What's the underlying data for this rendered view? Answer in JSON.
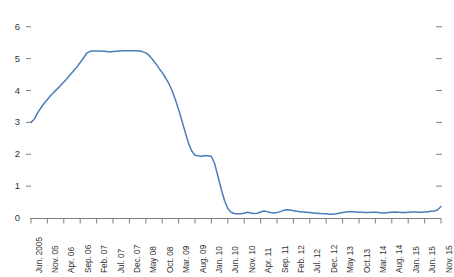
{
  "chart_data": {
    "type": "line",
    "title": "",
    "subtitle": "",
    "xlabel": "",
    "ylabel": "",
    "legend": [],
    "legend_position": "none",
    "grid": false,
    "xlim": [
      0,
      125
    ],
    "ylim": [
      0,
      6.4
    ],
    "y_ticks": [
      "0",
      "1",
      "2",
      "3",
      "4",
      "5",
      "6"
    ],
    "y_tick_values": [
      0,
      1,
      2,
      3,
      4,
      5,
      6
    ],
    "right_axis_ticks": [
      1,
      2,
      3,
      4,
      5,
      6
    ],
    "categories": [
      "Jun. 2005",
      "Nov. 05",
      "Apr. 06",
      "Sep. 06",
      "Feb. 07",
      "Jul. 07",
      "Dec. 07",
      "May 08",
      "Oct. 08",
      "Mar. 09",
      "Aug. 09",
      "Jan. 10",
      "Jun. 10",
      "Nov. 10",
      "Apr. 11",
      "Sep. 11",
      "Feb. 12",
      "Jul. 12",
      "Dec. 12",
      "May 13",
      "Oct.13",
      "Mar. 14",
      "Aug. 14",
      "Jan. 15",
      "Jun. 15",
      "Nov. 15"
    ],
    "category_index_step": 5,
    "series": [
      {
        "name": "",
        "color": "#4a7ebb",
        "x": [
          0,
          1,
          2,
          3,
          4,
          5,
          6,
          7,
          8,
          9,
          10,
          11,
          12,
          13,
          14,
          15,
          16,
          17,
          18,
          19,
          20,
          21,
          22,
          23,
          24,
          25,
          26,
          27,
          28,
          29,
          30,
          31,
          32,
          33,
          34,
          35,
          36,
          37,
          38,
          39,
          40,
          41,
          42,
          43,
          44,
          45,
          46,
          47,
          48,
          49,
          50,
          51,
          52,
          53,
          54,
          55,
          56,
          57,
          58,
          59,
          60,
          61,
          62,
          63,
          64,
          65,
          66,
          67,
          68,
          69,
          70,
          71,
          72,
          73,
          74,
          75,
          76,
          77,
          78,
          79,
          80,
          81,
          82,
          83,
          84,
          85,
          86,
          87,
          88,
          89,
          90,
          91,
          92,
          93,
          94,
          95,
          96,
          97,
          98,
          99,
          100,
          101,
          102,
          103,
          104,
          105,
          106,
          107,
          108,
          109,
          110,
          111,
          112,
          113,
          114,
          115,
          116,
          117,
          118,
          119,
          120,
          121,
          122,
          123,
          124,
          125
        ],
        "values": [
          3.0,
          3.1,
          3.3,
          3.45,
          3.6,
          3.72,
          3.84,
          3.95,
          4.05,
          4.16,
          4.27,
          4.38,
          4.5,
          4.62,
          4.74,
          4.88,
          5.02,
          5.17,
          5.23,
          5.24,
          5.24,
          5.24,
          5.23,
          5.22,
          5.21,
          5.22,
          5.23,
          5.24,
          5.25,
          5.25,
          5.25,
          5.25,
          5.25,
          5.24,
          5.22,
          5.18,
          5.1,
          4.98,
          4.85,
          4.7,
          4.56,
          4.4,
          4.22,
          4.0,
          3.72,
          3.4,
          3.05,
          2.7,
          2.35,
          2.1,
          1.97,
          1.95,
          1.94,
          1.96,
          1.95,
          1.93,
          1.7,
          1.3,
          0.9,
          0.55,
          0.3,
          0.18,
          0.14,
          0.13,
          0.13,
          0.15,
          0.18,
          0.16,
          0.14,
          0.15,
          0.19,
          0.22,
          0.2,
          0.17,
          0.16,
          0.17,
          0.2,
          0.24,
          0.26,
          0.25,
          0.23,
          0.21,
          0.2,
          0.19,
          0.18,
          0.17,
          0.16,
          0.15,
          0.14,
          0.13,
          0.13,
          0.12,
          0.12,
          0.13,
          0.15,
          0.17,
          0.19,
          0.2,
          0.2,
          0.19,
          0.18,
          0.18,
          0.17,
          0.17,
          0.18,
          0.18,
          0.17,
          0.16,
          0.16,
          0.17,
          0.18,
          0.19,
          0.18,
          0.17,
          0.17,
          0.18,
          0.19,
          0.19,
          0.18,
          0.18,
          0.19,
          0.2,
          0.21,
          0.22,
          0.26,
          0.36
        ]
      }
    ]
  },
  "axes": {
    "axis_color": "#808080",
    "tick_color": "#808080",
    "label_color": "#333333"
  }
}
